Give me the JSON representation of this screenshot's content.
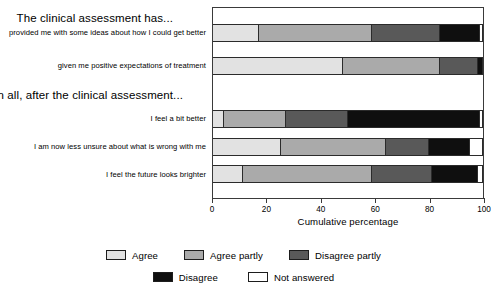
{
  "chart_data": {
    "type": "bar",
    "orientation": "horizontal",
    "stacked": true,
    "normalized_percent": true,
    "title": "",
    "xlabel": "Cumulative percentage",
    "ylabel": "",
    "xlim": [
      0,
      100
    ],
    "xticks": [
      0,
      20,
      40,
      60,
      80,
      100
    ],
    "xtick_labels": [
      "0",
      "20",
      "40",
      "60",
      "80",
      "100"
    ],
    "grid": false,
    "legend_position": "bottom",
    "group_headings": [
      "The clinical assessment has...",
      "All in all, after the clinical assessment..."
    ],
    "categories": [
      "provided me with some ideas about how I could get better",
      "given me positive expectations of treatment",
      "I feel a bit better",
      "I am now less unsure about what is wrong with me",
      "I feel the future looks brighter"
    ],
    "series": [
      {
        "name": "Agree",
        "color": "#e2e2e2",
        "values": [
          17,
          48,
          4,
          25,
          11
        ]
      },
      {
        "name": "Agree partly",
        "color": "#aaaaaa",
        "values": [
          42,
          36,
          23,
          39,
          48
        ]
      },
      {
        "name": "Disagree partly",
        "color": "#595959",
        "values": [
          25,
          14,
          23,
          16,
          22
        ]
      },
      {
        "name": "Disagree",
        "color": "#0f0f0f",
        "values": [
          15,
          2,
          49,
          15,
          17
        ]
      },
      {
        "name": "Not answered",
        "color": "#ffffff",
        "values": [
          1,
          0,
          1,
          5,
          2
        ]
      }
    ],
    "cumulative_boundaries": [
      [
        17,
        59,
        84,
        99,
        100
      ],
      [
        48,
        84,
        98,
        100,
        100
      ],
      [
        4,
        27,
        50,
        99,
        100
      ],
      [
        25,
        64,
        80,
        95,
        100
      ],
      [
        11,
        59,
        81,
        98,
        100
      ]
    ]
  },
  "axis": {
    "title": "Cumulative percentage",
    "ticks": [
      "0",
      "20",
      "40",
      "60",
      "80",
      "100"
    ]
  },
  "headings": {
    "group1": "The clinical assessment has...",
    "group2": "All in all, after the clinical assessment..."
  },
  "row_labels": {
    "r1": "provided me with some ideas about how I could get better",
    "r2": "given me positive expectations of treatment",
    "r3": "I feel a bit better",
    "r4": "I am now less unsure about what is wrong with me",
    "r5": "I feel the future looks brighter"
  },
  "legend": {
    "row1": [
      {
        "label": "Agree",
        "color": "#e2e2e2"
      },
      {
        "label": "Agree partly",
        "color": "#aaaaaa"
      },
      {
        "label": "Disagree partly",
        "color": "#595959"
      }
    ],
    "row2": [
      {
        "label": "Disagree",
        "color": "#0f0f0f"
      },
      {
        "label": "Not answered",
        "color": "#ffffff"
      }
    ]
  }
}
